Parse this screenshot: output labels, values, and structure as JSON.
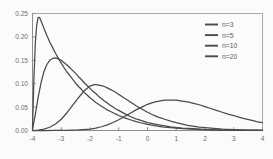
{
  "chart_data": {
    "type": "line",
    "title": "",
    "subtitle": "",
    "xlabel": "",
    "ylabel": "",
    "xlim": [
      -4,
      4
    ],
    "ylim": [
      0,
      0.25
    ],
    "grid": false,
    "legend_position": "top-right",
    "x_ticks": [
      "-4",
      "-3",
      "-2",
      "-1",
      "0",
      "1",
      "2",
      "3",
      "4"
    ],
    "x_tick_values": [
      -4,
      -3,
      -2,
      -1,
      0,
      1,
      2,
      3,
      4
    ],
    "y_ticks": [
      "0.00",
      "0.05",
      "0.10",
      "0.15",
      "0.20",
      "0.25"
    ],
    "y_tick_values": [
      0.0,
      0.05,
      0.1,
      0.15,
      0.2,
      0.25
    ],
    "legend": [
      "n=3",
      "n=5",
      "n=10",
      "n=20"
    ],
    "series": [
      {
        "name": "n=3",
        "peak_x": -3.78,
        "peak_y": 0.242,
        "x": [
          -4.0,
          -3.95,
          -3.9,
          -3.85,
          -3.8,
          -3.75,
          -3.7,
          -3.65,
          -3.6,
          -3.5,
          -3.4,
          -3.3,
          -3.2,
          -3.1,
          -3.0,
          -2.9,
          -2.8,
          -2.7,
          -2.6,
          -2.5,
          -2.4,
          -2.3,
          -2.2,
          -2.1,
          -2.0,
          -1.9,
          -1.8,
          -1.7,
          -1.6,
          -1.5,
          -1.4,
          -1.3,
          -1.2,
          -1.1,
          -1.0,
          -0.8,
          -0.6,
          -0.4,
          -0.2,
          0.0,
          0.5,
          1.0,
          1.5,
          2.0,
          2.5,
          3.0,
          3.5,
          4.0
        ],
        "y": [
          0.004,
          0.112,
          0.189,
          0.227,
          0.242,
          0.241,
          0.234,
          0.226,
          0.218,
          0.203,
          0.189,
          0.177,
          0.165,
          0.154,
          0.144,
          0.134,
          0.125,
          0.117,
          0.109,
          0.101,
          0.094,
          0.088,
          0.081,
          0.076,
          0.07,
          0.065,
          0.06,
          0.056,
          0.052,
          0.048,
          0.044,
          0.041,
          0.038,
          0.035,
          0.032,
          0.027,
          0.023,
          0.019,
          0.016,
          0.013,
          0.008,
          0.005,
          0.003,
          0.002,
          0.001,
          0.0006,
          0.0003,
          0.0002
        ]
      },
      {
        "name": "n=5",
        "peak_x": -3.2,
        "peak_y": 0.155,
        "x": [
          -4.0,
          -3.9,
          -3.8,
          -3.7,
          -3.6,
          -3.5,
          -3.4,
          -3.3,
          -3.2,
          -3.1,
          -3.0,
          -2.9,
          -2.8,
          -2.7,
          -2.6,
          -2.5,
          -2.4,
          -2.3,
          -2.2,
          -2.1,
          -2.0,
          -1.9,
          -1.8,
          -1.7,
          -1.6,
          -1.5,
          -1.4,
          -1.3,
          -1.2,
          -1.1,
          -1.0,
          -0.8,
          -0.6,
          -0.4,
          -0.2,
          0.0,
          0.4,
          0.8,
          1.2,
          1.6,
          2.0,
          2.5,
          3.0,
          3.5,
          4.0
        ],
        "y": [
          0.002,
          0.035,
          0.072,
          0.103,
          0.126,
          0.141,
          0.15,
          0.154,
          0.155,
          0.153,
          0.15,
          0.145,
          0.14,
          0.134,
          0.128,
          0.122,
          0.115,
          0.109,
          0.102,
          0.096,
          0.09,
          0.084,
          0.079,
          0.073,
          0.068,
          0.063,
          0.059,
          0.054,
          0.05,
          0.046,
          0.043,
          0.036,
          0.03,
          0.025,
          0.021,
          0.017,
          0.012,
          0.008,
          0.005,
          0.004,
          0.002,
          0.001,
          0.0006,
          0.0003,
          0.0002
        ]
      },
      {
        "name": "n=10",
        "peak_x": -1.85,
        "peak_y": 0.098,
        "x": [
          -4.0,
          -3.8,
          -3.6,
          -3.4,
          -3.2,
          -3.0,
          -2.8,
          -2.6,
          -2.4,
          -2.2,
          -2.0,
          -1.9,
          -1.85,
          -1.8,
          -1.7,
          -1.6,
          -1.5,
          -1.4,
          -1.3,
          -1.2,
          -1.1,
          -1.0,
          -0.9,
          -0.8,
          -0.7,
          -0.6,
          -0.5,
          -0.4,
          -0.2,
          0.0,
          0.2,
          0.4,
          0.6,
          0.8,
          1.0,
          1.4,
          1.8,
          2.2,
          2.6,
          3.0,
          3.4,
          3.8,
          4.0
        ],
        "y": [
          0.0001,
          0.001,
          0.003,
          0.007,
          0.014,
          0.024,
          0.038,
          0.054,
          0.07,
          0.085,
          0.095,
          0.097,
          0.098,
          0.098,
          0.097,
          0.096,
          0.094,
          0.091,
          0.088,
          0.085,
          0.081,
          0.077,
          0.073,
          0.069,
          0.065,
          0.061,
          0.057,
          0.053,
          0.046,
          0.039,
          0.033,
          0.028,
          0.024,
          0.02,
          0.017,
          0.011,
          0.007,
          0.005,
          0.003,
          0.002,
          0.001,
          0.0007,
          0.0005
        ]
      },
      {
        "name": "n=20",
        "peak_x": 0.85,
        "peak_y": 0.065,
        "x": [
          -4.0,
          -3.6,
          -3.2,
          -2.8,
          -2.4,
          -2.0,
          -1.8,
          -1.6,
          -1.4,
          -1.2,
          -1.0,
          -0.8,
          -0.6,
          -0.4,
          -0.2,
          0.0,
          0.2,
          0.4,
          0.6,
          0.8,
          0.85,
          1.0,
          1.2,
          1.4,
          1.6,
          1.8,
          2.0,
          2.2,
          2.4,
          2.6,
          2.8,
          3.0,
          3.2,
          3.4,
          3.6,
          3.8,
          4.0
        ],
        "y": [
          0.0,
          0.0,
          0.0001,
          0.0004,
          0.0012,
          0.003,
          0.005,
          0.008,
          0.012,
          0.017,
          0.023,
          0.03,
          0.037,
          0.044,
          0.05,
          0.056,
          0.06,
          0.063,
          0.065,
          0.065,
          0.065,
          0.065,
          0.063,
          0.061,
          0.058,
          0.055,
          0.051,
          0.047,
          0.043,
          0.039,
          0.035,
          0.032,
          0.028,
          0.025,
          0.022,
          0.019,
          0.017
        ]
      }
    ],
    "colors": {
      "curve": "#4a4a4a",
      "axis": "#8c8c8c",
      "frame": "#a9a9a9",
      "tick_label": "#6f6f6f",
      "legend_label": "#5d5d5d",
      "background": "#fbfbfb"
    }
  }
}
